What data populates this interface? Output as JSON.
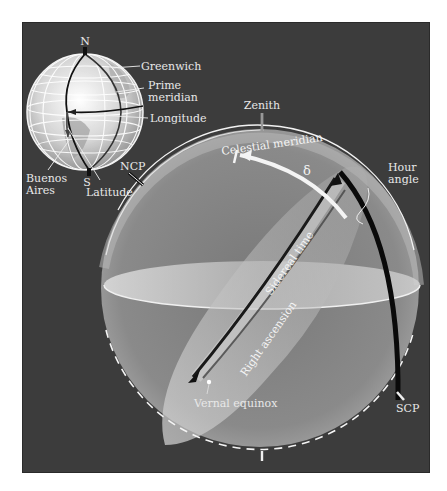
{
  "figure": {
    "colors": {
      "background": "#3c3c3c",
      "page": "#ffffff",
      "sphere_fill": "#8a8a8a",
      "highlight": "#f0f0f0",
      "dark_arc": "#0a0a0a"
    }
  },
  "globe": {
    "labels": {
      "north": "N",
      "south": "S",
      "greenwich": "Greenwich",
      "prime_meridian_line1": "Prime",
      "prime_meridian_line2": "meridian",
      "longitude": "Longitude",
      "buenos_aires_line1": "Buenos",
      "buenos_aires_line2": "Aires",
      "latitude": "Latitude"
    }
  },
  "celestial_sphere": {
    "labels": {
      "zenith": "Zenith",
      "ncp": "NCP",
      "scp": "SCP",
      "celestial_meridian": "Celestial meridian",
      "declination": "δ",
      "hour_angle_line1": "Hour",
      "hour_angle_line2": "angle",
      "sidereal_time": "Sidereal time",
      "right_ascension": "Right ascension",
      "vernal_equinox": "Vernal equinox"
    }
  }
}
